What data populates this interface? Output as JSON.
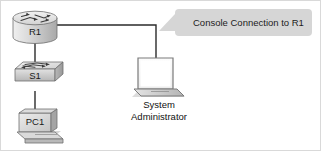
{
  "diagram": {
    "background_color": "#ffffff",
    "border_color": "#d9d9d9",
    "link_color": "#2b2b2b",
    "device_fill_light": "#e8e8e8",
    "device_fill_mid": "#c9c9c9",
    "device_fill_dark": "#a8a8a8",
    "device_stroke": "#6e6e6e",
    "callout_fill": "#d6d6d6",
    "callout_text_color": "#1c1c1c"
  },
  "nodes": {
    "router": {
      "label": "R1",
      "icon": "router-icon",
      "type": "router"
    },
    "switch": {
      "label": "S1",
      "icon": "switch-icon",
      "type": "switch"
    },
    "pc": {
      "label": "PC1",
      "icon": "desktop-pc-icon",
      "type": "workstation"
    },
    "laptop": {
      "icon": "laptop-icon",
      "type": "laptop",
      "caption_line1": "System",
      "caption_line2": "Administrator"
    }
  },
  "callout": {
    "text": "Console Connection to R1",
    "points_to": "console-link"
  },
  "links": [
    {
      "name": "link-router-switch",
      "from": "R1",
      "to": "S1"
    },
    {
      "name": "link-switch-pc",
      "from": "S1",
      "to": "PC1"
    },
    {
      "name": "link-console",
      "from": "R1",
      "to": "System Administrator"
    }
  ]
}
